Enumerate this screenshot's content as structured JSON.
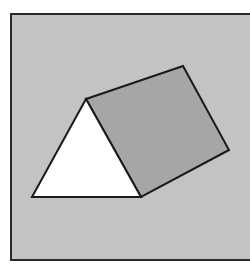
{
  "diagram": {
    "title": "",
    "background": "#ffffff",
    "frame": {
      "x": 11,
      "y": 14,
      "width": 245,
      "height": 246,
      "fill": "#c3c3c3",
      "stroke": "#2a2a2a",
      "stroke_width": 2
    },
    "shapes": [
      {
        "id": "triangle",
        "type": "triangle",
        "points": "86,99 32,197 141,197",
        "fill": "#ffffff",
        "stroke": "#1a1a1a",
        "stroke_width": 2
      },
      {
        "id": "parallelogram",
        "type": "quadrilateral",
        "points": "86,99 183,66 229,150 141,197",
        "fill": "#a6a6a6",
        "stroke": "#1a1a1a",
        "stroke_width": 2
      }
    ]
  }
}
